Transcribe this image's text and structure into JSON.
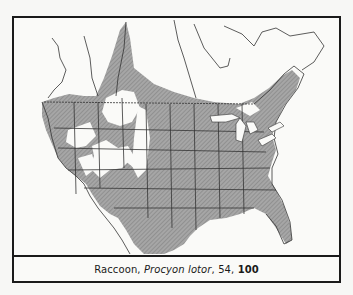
{
  "map": {
    "subject": "Raccoon range map of North America",
    "range_fill": "#9a9a9a",
    "land_fill": "#fafaf8",
    "border_color": "#333333"
  },
  "caption": {
    "common_name": "Raccoon",
    "sep1": ", ",
    "scientific_name": "Procyon lotor",
    "sep2": ", ",
    "page_ref": "54",
    "sep3": ", ",
    "map_number": "100"
  }
}
